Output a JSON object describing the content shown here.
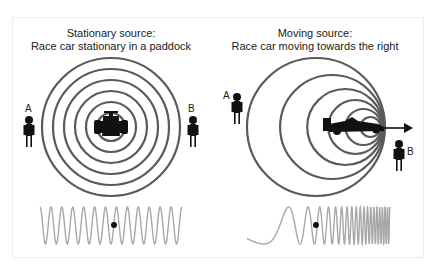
{
  "left_panel": {
    "title_line1": "Stationary source:",
    "title_line2": "Race car stationary in a paddock",
    "observer_a": "A",
    "observer_b": "B",
    "ring_count": 6,
    "wave_cycles": 13
  },
  "right_panel": {
    "title_line1": "Moving source:",
    "title_line2": "Race car moving towards the right",
    "observer_a": "A",
    "observer_b": "B",
    "ring_count": 6,
    "direction": "right"
  },
  "colors": {
    "ring": "#5a5a5a",
    "wave": "#a8a8a8",
    "figure": "#111111",
    "frame": "#ececec"
  }
}
